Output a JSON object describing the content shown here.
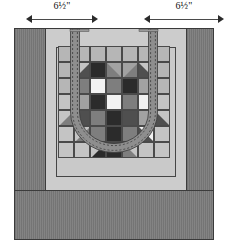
{
  "diagram": {
    "dimensions": [
      {
        "name": "left-side-width",
        "label": "6½\""
      },
      {
        "name": "right-side-width",
        "label": "6½\""
      }
    ],
    "bag": {
      "side_panel_color": "#7d7d7d",
      "bottom_panel_color": "#7d7d7d",
      "front_panel_color": "#cccccc",
      "inner_border_color": "#c9c9c9",
      "outline_color": "#3a3a3a"
    },
    "handles": {
      "name": "bag-handle-strap",
      "strap_fill": "#8e8e8e",
      "stitch_color": "#2f2f2f",
      "stitch_style": "dashed-topstitching",
      "count": 2
    },
    "palette": {
      "black": "#2b2b2b",
      "dark": "#4f4f4f",
      "medium": "#7e7e7e",
      "light_medium": "#a2a2a2",
      "light": "#c4c4c4",
      "white": "#f2f2f2",
      "background": "#b6b6b6",
      "grid_line": "#4a4a4a"
    }
  },
  "chart_data": {
    "type": "heatmap",
    "xlabel": "column",
    "ylabel": "row",
    "grid": true,
    "legend": "none",
    "categories": [
      "c1",
      "c2",
      "c3",
      "c4",
      "c5",
      "c6",
      "c7"
    ],
    "rows": [
      "r1",
      "r2",
      "r3",
      "r4",
      "r5",
      "r6",
      "r7"
    ],
    "cells": [
      [
        {
          "fill": "background",
          "tri": null
        },
        {
          "fill": "background",
          "tri": null
        },
        {
          "fill": "background",
          "tri": null
        },
        {
          "fill": "background",
          "tri": null
        },
        {
          "fill": "background",
          "tri": null
        },
        {
          "fill": "background",
          "tri": null
        },
        {
          "fill": "background",
          "tri": null
        }
      ],
      [
        {
          "fill": "background",
          "tri": null
        },
        {
          "fill": "light",
          "tri": {
            "corner": "br",
            "fill": "dark"
          }
        },
        {
          "fill": "black",
          "tri": null
        },
        {
          "fill": "light_medium",
          "tri": {
            "corner": "bl",
            "fill": "medium"
          }
        },
        {
          "fill": "light_medium",
          "tri": {
            "corner": "br",
            "fill": "medium"
          }
        },
        {
          "fill": "dark",
          "tri": {
            "corner": "tr",
            "fill": "light"
          }
        },
        {
          "fill": "background",
          "tri": null
        }
      ],
      [
        {
          "fill": "background",
          "tri": null
        },
        {
          "fill": "medium",
          "tri": null
        },
        {
          "fill": "white",
          "tri": null
        },
        {
          "fill": "medium",
          "tri": null
        },
        {
          "fill": "black",
          "tri": null
        },
        {
          "fill": "light_medium",
          "tri": null
        },
        {
          "fill": "background",
          "tri": null
        }
      ],
      [
        {
          "fill": "light",
          "tri": null
        },
        {
          "fill": "light_medium",
          "tri": null
        },
        {
          "fill": "black",
          "tri": null
        },
        {
          "fill": "white",
          "tri": null
        },
        {
          "fill": "medium",
          "tri": null
        },
        {
          "fill": "white",
          "tri": null
        },
        {
          "fill": "light",
          "tri": null
        }
      ],
      [
        {
          "fill": "light",
          "tri": {
            "corner": "br",
            "fill": "medium"
          }
        },
        {
          "fill": "dark",
          "tri": null
        },
        {
          "fill": "medium",
          "tri": null
        },
        {
          "fill": "black",
          "tri": null
        },
        {
          "fill": "dark",
          "tri": null
        },
        {
          "fill": "light_medium",
          "tri": null
        },
        {
          "fill": "light",
          "tri": {
            "corner": "bl",
            "fill": "dark"
          }
        }
      ],
      [
        {
          "fill": "light",
          "tri": null
        },
        {
          "fill": "light",
          "tri": {
            "corner": "br",
            "fill": "medium"
          }
        },
        {
          "fill": "medium",
          "tri": null
        },
        {
          "fill": "black",
          "tri": null
        },
        {
          "fill": "medium",
          "tri": null
        },
        {
          "fill": "white",
          "tri": {
            "corner": "bl",
            "fill": "dark"
          }
        },
        {
          "fill": "light",
          "tri": null
        }
      ],
      [
        {
          "fill": "light",
          "tri": null
        },
        {
          "fill": "light",
          "tri": null
        },
        {
          "fill": "light",
          "tri": {
            "corner": "br",
            "fill": "black"
          }
        },
        {
          "fill": "black",
          "tri": null
        },
        {
          "fill": "light",
          "tri": {
            "corner": "bl",
            "fill": "medium"
          }
        },
        {
          "fill": "light",
          "tri": null
        },
        {
          "fill": "light",
          "tri": null
        }
      ]
    ]
  }
}
